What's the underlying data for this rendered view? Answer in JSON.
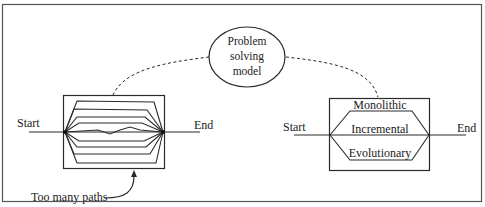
{
  "diagram": {
    "type": "problem-solving-approaches",
    "center_node": {
      "lines": [
        "Problem",
        "solving",
        "model"
      ]
    },
    "left_panel": {
      "start_label": "Start",
      "end_label": "End",
      "annotation": "Too many paths",
      "path_count": 8
    },
    "right_panel": {
      "start_label": "Start",
      "end_label": "End",
      "paths": [
        {
          "label": "Monolithic",
          "position": "top"
        },
        {
          "label": "Incremental",
          "position": "middle"
        },
        {
          "label": "Evolutionary",
          "position": "bottom"
        }
      ]
    },
    "colors": {
      "stroke": "#2a2a2a",
      "frame": "#555555",
      "background": "#ffffff"
    }
  }
}
